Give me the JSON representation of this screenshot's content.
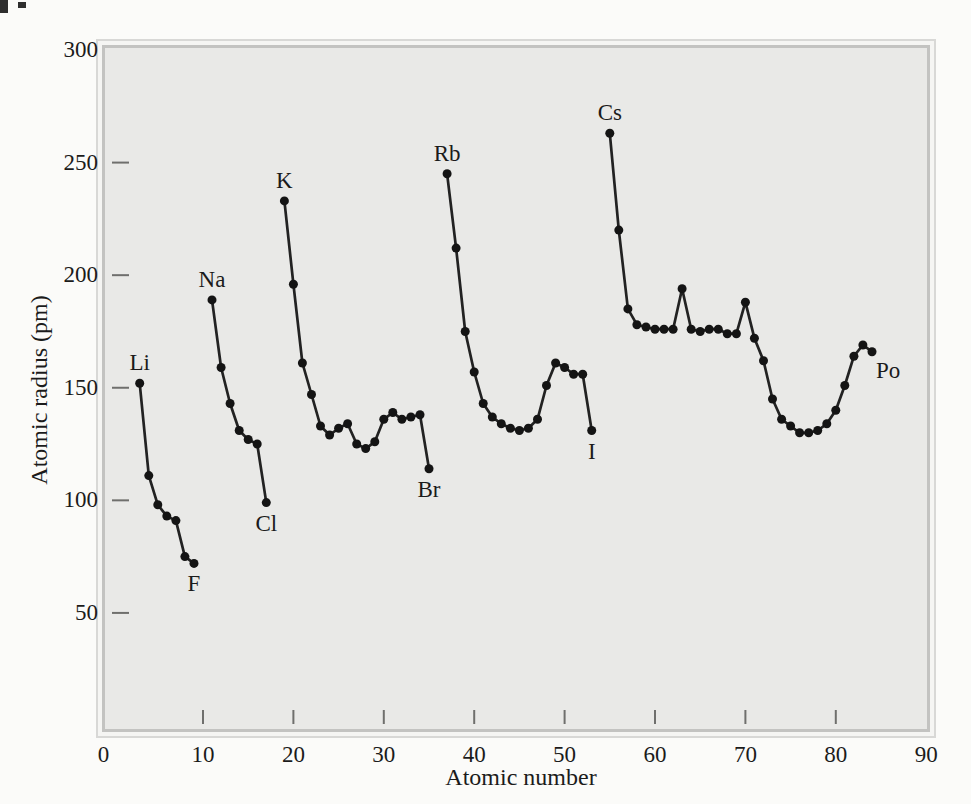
{
  "chart_data": {
    "type": "line",
    "title": "",
    "xlabel": "Atomic number",
    "ylabel": "Atomic radius (pm)",
    "xlim": [
      0,
      90
    ],
    "ylim": [
      0,
      300
    ],
    "x_ticks": [
      0,
      10,
      20,
      30,
      40,
      50,
      60,
      70,
      80,
      90
    ],
    "y_ticks": [
      300,
      250,
      200,
      150,
      100,
      50
    ],
    "grid": false,
    "legend": "none",
    "line_color": "#222222",
    "point_color": "#141414",
    "series": [
      {
        "name": "Period 2 (Li to F)",
        "elements": [
          "Li",
          "Be",
          "B",
          "C",
          "N",
          "O",
          "F"
        ],
        "x": [
          3,
          4,
          5,
          6,
          7,
          8,
          9
        ],
        "r_pm": [
          152,
          111,
          98,
          93,
          91,
          75,
          72
        ]
      },
      {
        "name": "Period 3 (Na to Cl)",
        "elements": [
          "Na",
          "Mg",
          "Al",
          "Si",
          "P",
          "S",
          "Cl"
        ],
        "x": [
          11,
          12,
          13,
          14,
          15,
          16,
          17
        ],
        "r_pm": [
          189,
          159,
          143,
          131,
          127,
          125,
          99
        ]
      },
      {
        "name": "Period 4 (K to Br)",
        "elements": [
          "K",
          "Ca",
          "Sc",
          "Ti",
          "V",
          "Cr",
          "Mn",
          "Fe",
          "Co",
          "Ni",
          "Cu",
          "Zn",
          "Ga",
          "Ge",
          "As",
          "Se",
          "Br"
        ],
        "x": [
          19,
          20,
          21,
          22,
          23,
          24,
          25,
          26,
          27,
          28,
          29,
          30,
          31,
          32,
          33,
          34,
          35
        ],
        "r_pm": [
          233,
          196,
          161,
          147,
          133,
          129,
          132,
          134,
          125,
          123,
          126,
          136,
          139,
          136,
          137,
          138,
          114
        ]
      },
      {
        "name": "Period 5 (Rb to I)",
        "elements": [
          "Rb",
          "Sr",
          "Y",
          "Zr",
          "Nb",
          "Mo",
          "Tc",
          "Ru",
          "Rh",
          "Pd",
          "Ag",
          "Cd",
          "In",
          "Sn",
          "Sb",
          "Te",
          "I"
        ],
        "x": [
          37,
          38,
          39,
          40,
          41,
          42,
          43,
          44,
          45,
          46,
          47,
          48,
          49,
          50,
          51,
          52,
          53
        ],
        "r_pm": [
          245,
          212,
          175,
          157,
          143,
          137,
          134,
          132,
          131,
          132,
          136,
          151,
          161,
          159,
          156,
          156,
          131
        ]
      },
      {
        "name": "Period 6 (Cs to Po)",
        "elements": [
          "Cs",
          "Ba",
          "La",
          "Ce",
          "Pr",
          "Nd",
          "Pm",
          "Sm",
          "Eu",
          "Gd",
          "Tb",
          "Dy",
          "Ho",
          "Er",
          "Tm",
          "Yb",
          "Lu",
          "Hf",
          "Ta",
          "W",
          "Re",
          "Os",
          "Ir",
          "Pt",
          "Au",
          "Hg",
          "Tl",
          "Pb",
          "Bi",
          "Po"
        ],
        "x": [
          55,
          56,
          57,
          58,
          59,
          60,
          61,
          62,
          63,
          64,
          65,
          66,
          67,
          68,
          69,
          70,
          71,
          72,
          73,
          74,
          75,
          76,
          77,
          78,
          79,
          80,
          81,
          82,
          83,
          84
        ],
        "r_pm": [
          263,
          220,
          185,
          178,
          177,
          176,
          176,
          176,
          194,
          176,
          175,
          176,
          176,
          174,
          174,
          188,
          172,
          162,
          145,
          136,
          133,
          130,
          130,
          131,
          134,
          140,
          151,
          164,
          169,
          166
        ]
      }
    ],
    "point_labels": [
      {
        "symbol": "Li",
        "n": 3,
        "placement": "above"
      },
      {
        "symbol": "F",
        "n": 9,
        "placement": "below"
      },
      {
        "symbol": "Na",
        "n": 11,
        "placement": "above"
      },
      {
        "symbol": "Cl",
        "n": 17,
        "placement": "below"
      },
      {
        "symbol": "K",
        "n": 19,
        "placement": "above"
      },
      {
        "symbol": "Br",
        "n": 35,
        "placement": "below"
      },
      {
        "symbol": "Rb",
        "n": 37,
        "placement": "above"
      },
      {
        "symbol": "I",
        "n": 53,
        "placement": "below"
      },
      {
        "symbol": "Cs",
        "n": 55,
        "placement": "above"
      },
      {
        "symbol": "Po",
        "n": 84,
        "placement": "right"
      }
    ]
  }
}
